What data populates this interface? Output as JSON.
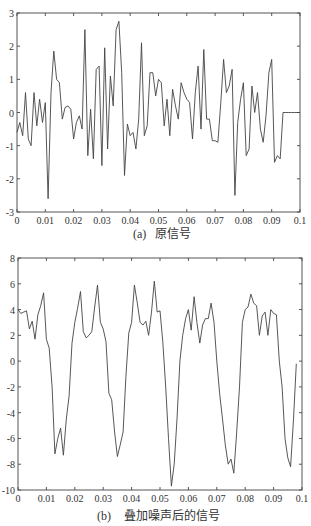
{
  "chart_data": [
    {
      "type": "line",
      "title": "",
      "caption_label": "(a)",
      "caption_text": "原信号",
      "xlabel": "",
      "ylabel": "",
      "xlim": [
        0,
        0.1
      ],
      "ylim": [
        -3,
        3
      ],
      "grid": false,
      "xticks": [
        "0",
        "0.01",
        "0.02",
        "0.03",
        "0.04",
        "0.05",
        "0.06",
        "0.07",
        "0.08",
        "0.09",
        "0.1"
      ],
      "yticks": [
        "3",
        "2",
        "1",
        "0",
        "-1",
        "-2",
        "-3"
      ],
      "x": [
        0,
        0.001,
        0.002,
        0.003,
        0.004,
        0.005,
        0.006,
        0.007,
        0.008,
        0.009,
        0.01,
        0.011,
        0.012,
        0.013,
        0.014,
        0.015,
        0.016,
        0.017,
        0.018,
        0.019,
        0.02,
        0.021,
        0.022,
        0.023,
        0.024,
        0.025,
        0.026,
        0.027,
        0.028,
        0.029,
        0.03,
        0.031,
        0.032,
        0.033,
        0.034,
        0.035,
        0.036,
        0.037,
        0.038,
        0.039,
        0.04,
        0.041,
        0.042,
        0.043,
        0.044,
        0.045,
        0.046,
        0.047,
        0.048,
        0.049,
        0.05,
        0.051,
        0.052,
        0.053,
        0.054,
        0.055,
        0.056,
        0.057,
        0.058,
        0.059,
        0.06,
        0.061,
        0.062,
        0.063,
        0.064,
        0.065,
        0.066,
        0.067,
        0.068,
        0.069,
        0.07,
        0.071,
        0.072,
        0.073,
        0.074,
        0.075,
        0.076,
        0.077,
        0.078,
        0.079,
        0.08,
        0.081,
        0.082,
        0.083,
        0.084,
        0.085,
        0.086,
        0.087,
        0.088,
        0.089,
        0.09,
        0.091,
        0.092,
        0.093,
        0.094,
        0.095,
        0.096,
        0.097,
        0.098,
        0.099,
        0.1
      ],
      "values": [
        -0.6,
        -0.3,
        -0.7,
        0.6,
        -0.8,
        -1.0,
        0.6,
        -0.4,
        0.4,
        -0.3,
        0.3,
        -2.6,
        0.6,
        1.85,
        1.0,
        0.9,
        -0.2,
        0.15,
        0.2,
        0.1,
        -0.8,
        -0.3,
        -0.1,
        -0.5,
        2.5,
        -1.3,
        0.1,
        -1.4,
        1.3,
        1.4,
        -1.6,
        1.95,
        -1.1,
        1.1,
        0.2,
        2.5,
        2.75,
        1.2,
        -1.9,
        -0.35,
        -0.7,
        -0.6,
        -1.1,
        -0.2,
        2.1,
        -0.7,
        -0.4,
        1.2,
        1.2,
        0.5,
        1.0,
        0.9,
        -0.4,
        0.4,
        -0.7,
        0.7,
        0.2,
        -0.2,
        0.9,
        0.6,
        0.4,
        0.3,
        -0.8,
        0.6,
        1.4,
        -0.5,
        1.9,
        -0.2,
        -0.2,
        -0.85,
        -0.85,
        -0.9,
        0.3,
        1.6,
        0.6,
        0.8,
        1.3,
        -2.5,
        -0.3,
        0.4,
        0.9,
        -1.3,
        -1.1,
        0.8,
        0.0,
        0.6,
        -0.5,
        -0.9,
        -0.1,
        1.2,
        1.6,
        -1.5,
        -1.3,
        -1.4,
        0.0,
        0.0,
        0.0,
        0.0,
        0.0,
        0.0,
        0.0
      ]
    },
    {
      "type": "line",
      "title": "",
      "caption_label": "(b)",
      "caption_text": "叠加噪声后的信号",
      "xlabel": "",
      "ylabel": "",
      "xlim": [
        0,
        0.1
      ],
      "ylim": [
        -10,
        8
      ],
      "grid": false,
      "xticks": [
        "0",
        "0.01",
        "0.02",
        "0.03",
        "0.04",
        "0.05",
        "0.06",
        "0.07",
        "0.08",
        "0.09",
        "0.1"
      ],
      "yticks": [
        "8",
        "6",
        "4",
        "2",
        "0",
        "-2",
        "-4",
        "-6",
        "-8",
        "-10"
      ],
      "x": [
        0,
        0.001,
        0.002,
        0.003,
        0.004,
        0.005,
        0.006,
        0.007,
        0.008,
        0.009,
        0.01,
        0.011,
        0.012,
        0.013,
        0.014,
        0.015,
        0.016,
        0.017,
        0.018,
        0.019,
        0.02,
        0.021,
        0.022,
        0.023,
        0.024,
        0.025,
        0.026,
        0.027,
        0.028,
        0.029,
        0.03,
        0.031,
        0.032,
        0.033,
        0.034,
        0.035,
        0.036,
        0.037,
        0.038,
        0.039,
        0.04,
        0.041,
        0.042,
        0.043,
        0.044,
        0.045,
        0.046,
        0.047,
        0.048,
        0.049,
        0.05,
        0.051,
        0.052,
        0.053,
        0.054,
        0.055,
        0.056,
        0.057,
        0.058,
        0.059,
        0.06,
        0.061,
        0.062,
        0.063,
        0.064,
        0.065,
        0.066,
        0.067,
        0.068,
        0.069,
        0.07,
        0.071,
        0.072,
        0.073,
        0.074,
        0.075,
        0.076,
        0.077,
        0.078,
        0.079,
        0.08,
        0.081,
        0.082,
        0.083,
        0.084,
        0.085,
        0.086,
        0.087,
        0.088,
        0.089,
        0.09,
        0.091,
        0.092,
        0.093,
        0.094,
        0.095,
        0.096,
        0.097,
        0.098
      ],
      "values": [
        4.0,
        3.7,
        3.8,
        3.9,
        2.5,
        3.1,
        1.7,
        3.6,
        4.3,
        5.3,
        1.7,
        1.0,
        -2.0,
        -7.2,
        -6.0,
        -5.2,
        -7.3,
        -4.5,
        -2.7,
        1.4,
        3.0,
        4.1,
        5.4,
        2.3,
        1.8,
        2.0,
        2.3,
        4.2,
        5.9,
        3.0,
        2.5,
        1.5,
        -2.5,
        -3.0,
        -5.5,
        -7.4,
        -6.5,
        -5.5,
        -1.2,
        2.2,
        3.0,
        5.9,
        4.5,
        3.0,
        2.8,
        3.1,
        2.0,
        3.8,
        6.2,
        3.8,
        3.9,
        1.5,
        -2.0,
        -6.0,
        -9.7,
        -8.0,
        -4.5,
        0.0,
        2.0,
        3.3,
        4.0,
        2.4,
        5.0,
        3.0,
        1.4,
        2.8,
        3.3,
        3.3,
        4.5,
        3.0,
        0.0,
        -2.5,
        -4.5,
        -6.5,
        -8.0,
        -7.6,
        -8.7,
        -5.5,
        -2.0,
        3.0,
        4.0,
        4.2,
        5.2,
        4.5,
        4.3,
        2.0,
        3.5,
        3.8,
        2.0,
        4.0,
        3.7,
        3.6,
        0.0,
        -2.0,
        -6.0,
        -7.5,
        -8.2,
        -4.5,
        -0.2
      ]
    }
  ]
}
